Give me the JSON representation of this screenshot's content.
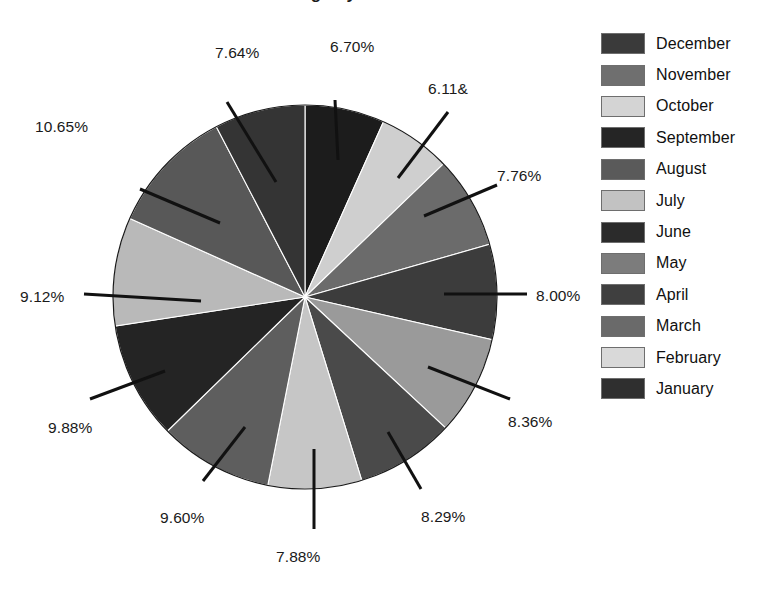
{
  "chart_data": {
    "type": "pie",
    "title": "Sales Percentage by Month",
    "subtitle": "",
    "xlabel": "",
    "ylabel": "",
    "legend_position": "right",
    "grid": false,
    "units": "percent",
    "start_angle_deg": 0,
    "direction": "clockwise",
    "center": {
      "x": 305,
      "y": 297,
      "r": 192
    },
    "categories": [
      "December",
      "November",
      "October",
      "September",
      "August",
      "July",
      "June",
      "May",
      "April",
      "March",
      "February",
      "January"
    ],
    "values": [
      6.7,
      6.11,
      7.76,
      8.0,
      8.36,
      8.29,
      7.88,
      9.6,
      9.88,
      9.12,
      10.65,
      7.64
    ],
    "labels": [
      "6.70%",
      "6.11&",
      "7.76%",
      "8.00%",
      "8.36%",
      "8.29%",
      "7.88%",
      "9.60%",
      "9.88%",
      "9.12%",
      "10.65%",
      "7.64%"
    ],
    "colors": [
      "#1c1c1c",
      "#cfcfcf",
      "#6b6b6b",
      "#3c3c3c",
      "#9a9a9a",
      "#4a4a4a",
      "#c6c6c6",
      "#5e5e5e",
      "#242424",
      "#b9b9b9",
      "#585858",
      "#343434"
    ],
    "slices": [
      {
        "name": "December",
        "value": 6.7,
        "label": "6.70%",
        "color": "#1c1c1c",
        "label_x": 330,
        "label_y": 38,
        "leader": [
          335,
          100,
          338,
          160
        ]
      },
      {
        "name": "November",
        "value": 6.11,
        "label": "6.11&",
        "color": "#cfcfcf",
        "label_x": 428,
        "label_y": 80,
        "leader": [
          448,
          112,
          398,
          178
        ]
      },
      {
        "name": "October",
        "value": 7.76,
        "label": "7.76%",
        "color": "#6b6b6b",
        "label_x": 497,
        "label_y": 167,
        "leader": [
          497,
          185,
          424,
          216
        ]
      },
      {
        "name": "September",
        "value": 8.0,
        "label": "8.00%",
        "color": "#3c3c3c",
        "label_x": 536,
        "label_y": 287,
        "leader": [
          527,
          294,
          444,
          294
        ]
      },
      {
        "name": "August",
        "value": 8.36,
        "label": "8.36%",
        "color": "#9a9a9a",
        "label_x": 508,
        "label_y": 413,
        "leader": [
          510,
          399,
          428,
          367
        ]
      },
      {
        "name": "July",
        "value": 8.29,
        "label": "8.29%",
        "color": "#4a4a4a",
        "label_x": 421,
        "label_y": 508,
        "leader": [
          421,
          489,
          388,
          432
        ]
      },
      {
        "name": "June",
        "value": 7.88,
        "label": "7.88%",
        "color": "#c6c6c6",
        "label_x": 276,
        "label_y": 548,
        "leader": [
          314,
          529,
          314,
          449
        ]
      },
      {
        "name": "May",
        "value": 9.6,
        "label": "9.60%",
        "color": "#5e5e5e",
        "label_x": 160,
        "label_y": 509,
        "leader": [
          203,
          481,
          245,
          427
        ]
      },
      {
        "name": "April",
        "value": 9.88,
        "label": "9.88%",
        "color": "#242424",
        "label_x": 48,
        "label_y": 419,
        "leader": [
          90,
          399,
          165,
          371
        ]
      },
      {
        "name": "March",
        "value": 9.12,
        "label": "9.12%",
        "color": "#b9b9b9",
        "label_x": 20,
        "label_y": 288,
        "leader": [
          84,
          294,
          201,
          301
        ]
      },
      {
        "name": "February",
        "value": 10.65,
        "label": "10.65%",
        "color": "#585858",
        "label_x": 35,
        "label_y": 118,
        "leader": [
          140,
          189,
          220,
          223
        ]
      },
      {
        "name": "January",
        "value": 7.64,
        "label": "7.64%",
        "color": "#343434",
        "label_x": 215,
        "label_y": 44,
        "leader": [
          227,
          102,
          276,
          182
        ]
      }
    ]
  },
  "legend": {
    "items": [
      {
        "label": "December",
        "color": "#3a3a3a"
      },
      {
        "label": "November",
        "color": "#6f6f6f"
      },
      {
        "label": "October",
        "color": "#d4d4d4"
      },
      {
        "label": "September",
        "color": "#252525"
      },
      {
        "label": "August",
        "color": "#5a5a5a"
      },
      {
        "label": "July",
        "color": "#c2c2c2"
      },
      {
        "label": "June",
        "color": "#2b2b2b"
      },
      {
        "label": "May",
        "color": "#7c7c7c"
      },
      {
        "label": "April",
        "color": "#3f3f3f"
      },
      {
        "label": "March",
        "color": "#6a6a6a"
      },
      {
        "label": "February",
        "color": "#d9d9d9"
      },
      {
        "label": "January",
        "color": "#2f2f2f"
      }
    ]
  }
}
